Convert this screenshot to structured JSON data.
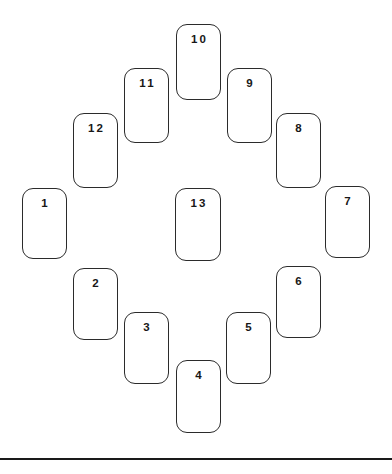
{
  "page": {
    "background_color": "#ffffff",
    "width": 392,
    "height": 474
  },
  "style": {
    "card_fill": "#ffffff",
    "card_stroke": "#2b2b2b",
    "label_color": "#171717",
    "rule_color": "#1a1a1a"
  },
  "baseline_rule": {
    "name": "bottom-horizontal-rule",
    "x": 0,
    "y": 458,
    "width": 392,
    "height": 2
  },
  "cards": [
    {
      "label": "1",
      "x": 22,
      "y": 188,
      "w": 45,
      "h": 71
    },
    {
      "label": "2",
      "x": 73,
      "y": 268,
      "w": 45,
      "h": 72
    },
    {
      "label": "3",
      "x": 124,
      "y": 312,
      "w": 45,
      "h": 72
    },
    {
      "label": "4",
      "x": 176,
      "y": 360,
      "w": 45,
      "h": 73
    },
    {
      "label": "5",
      "x": 226,
      "y": 312,
      "w": 45,
      "h": 72
    },
    {
      "label": "6",
      "x": 276,
      "y": 266,
      "w": 45,
      "h": 72
    },
    {
      "label": "7",
      "x": 325,
      "y": 186,
      "w": 45,
      "h": 72
    },
    {
      "label": "8",
      "x": 276,
      "y": 113,
      "w": 45,
      "h": 75
    },
    {
      "label": "9",
      "x": 227,
      "y": 68,
      "w": 45,
      "h": 75
    },
    {
      "label": "10",
      "x": 176,
      "y": 24,
      "w": 45,
      "h": 76
    },
    {
      "label": "11",
      "x": 124,
      "y": 68,
      "w": 45,
      "h": 75
    },
    {
      "label": "12",
      "x": 73,
      "y": 113,
      "w": 45,
      "h": 75
    },
    {
      "label": "13",
      "x": 175,
      "y": 188,
      "w": 46,
      "h": 73
    }
  ]
}
